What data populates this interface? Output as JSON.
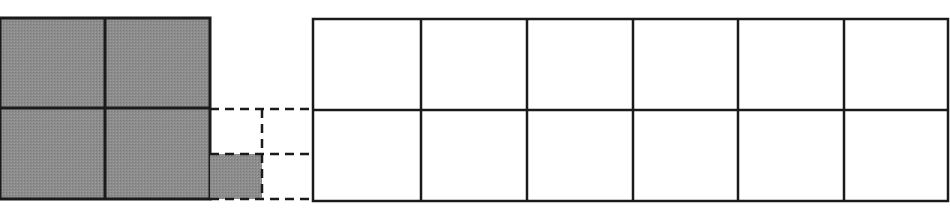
{
  "diagram": {
    "type": "area-model-grids",
    "colors": {
      "shade": "#8c8c8c",
      "stroke": "#1a1a1a",
      "background": "#ffffff"
    },
    "shaded_grid": {
      "rows": 2,
      "cols": 2,
      "x": 0,
      "y": 18,
      "width": 210,
      "height": 181,
      "col_lines": [
        105
      ],
      "row_lines": [
        108
      ]
    },
    "dashed_extension": {
      "horizontal_lines_y": [
        109,
        154,
        199
      ],
      "x_start": 210,
      "x_end": 313,
      "vertical_line_x": 262,
      "vertical_y_start": 109,
      "vertical_y_end": 199,
      "shaded_cell": {
        "x": 210,
        "y": 154,
        "width": 52,
        "height": 45
      }
    },
    "empty_grid": {
      "rows": 2,
      "cols": 6,
      "x": 313,
      "y": 19,
      "width": 635,
      "height": 182,
      "col_lines": [
        421,
        527,
        633,
        738,
        844
      ],
      "row_lines": [
        110
      ]
    }
  }
}
